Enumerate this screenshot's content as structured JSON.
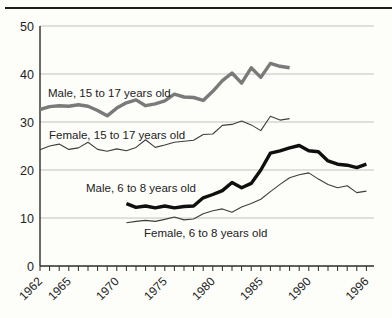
{
  "page": {
    "background_color": "#fdfdfa",
    "top_rule_color": "#1c1c1c"
  },
  "chart_data": {
    "type": "line",
    "title": "",
    "xlabel": "",
    "ylabel": "",
    "x_axis": {
      "start_year": 1962,
      "end_year": 1996,
      "tick_every_years": 1,
      "labeled_years": [
        1962,
        1965,
        1970,
        1975,
        1980,
        1985,
        1990,
        1996
      ],
      "label_rotation_deg": -45
    },
    "y_axis": {
      "ticks": [
        0,
        10,
        20,
        30,
        40,
        50
      ],
      "range": [
        0,
        50
      ]
    },
    "grid": {
      "horizontal": true,
      "vertical": false,
      "color": "#b3b3b3"
    },
    "axis_color": "#2b2b2b",
    "legend_position": "inline-labels",
    "series": [
      {
        "id": "male-15-17",
        "label": "Male, 15 to 17 years old",
        "start_year": 1962,
        "color": "#7a7a7a",
        "stroke_width": 3.4,
        "values": [
          32.6,
          33.2,
          33.4,
          33.3,
          33.6,
          33.3,
          32.4,
          31.3,
          32.9,
          34.0,
          34.6,
          33.4,
          33.8,
          34.4,
          35.8,
          35.2,
          35.1,
          34.5,
          36.4,
          38.6,
          40.2,
          38.1,
          41.3,
          39.3,
          42.2,
          41.6,
          41.3
        ]
      },
      {
        "id": "female-15-17",
        "label": "Female, 15 to 17 years old",
        "start_year": 1962,
        "color": "#3d3d3d",
        "stroke_width": 1.1,
        "values": [
          24.2,
          25.0,
          25.4,
          24.3,
          24.6,
          25.8,
          24.3,
          23.9,
          24.4,
          24.0,
          24.7,
          26.3,
          24.7,
          25.2,
          25.8,
          26.0,
          26.2,
          27.4,
          27.5,
          29.3,
          29.5,
          30.2,
          29.4,
          28.2,
          31.2,
          30.4,
          30.7
        ]
      },
      {
        "id": "male-6-8",
        "label": "Male, 6 to 8 years old",
        "start_year": 1971,
        "color": "#0f0f0f",
        "stroke_width": 3.4,
        "values": [
          13.0,
          12.2,
          12.5,
          12.1,
          12.5,
          12.1,
          12.4,
          12.5,
          14.2,
          14.9,
          15.7,
          17.4,
          16.3,
          17.2,
          20.0,
          23.5,
          24.0,
          24.6,
          25.1,
          24.0,
          23.8,
          21.9,
          21.2,
          21.0,
          20.5,
          21.2
        ]
      },
      {
        "id": "female-6-8",
        "label": "Female, 6 to 8 years old",
        "start_year": 1971,
        "color": "#3d3d3d",
        "stroke_width": 1.1,
        "values": [
          9.0,
          9.3,
          9.5,
          9.3,
          9.7,
          10.2,
          9.6,
          9.8,
          10.9,
          11.5,
          11.9,
          11.2,
          12.3,
          13.0,
          13.9,
          15.5,
          17.0,
          18.4,
          19.0,
          19.4,
          18.1,
          17.0,
          16.3,
          16.7,
          15.3,
          15.6
        ]
      }
    ],
    "series_inline_labels": [
      {
        "series": "male-15-17",
        "x": 48,
        "y": 97
      },
      {
        "series": "female-15-17",
        "x": 49,
        "y": 139
      },
      {
        "series": "male-6-8",
        "x": 86,
        "y": 192
      },
      {
        "series": "female-6-8",
        "x": 144,
        "y": 237
      }
    ]
  }
}
